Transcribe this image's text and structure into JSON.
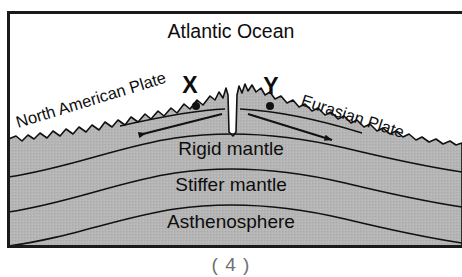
{
  "figure": {
    "title": "Atlantic Ocean",
    "caption": "( 4 )",
    "colors": {
      "mantle_fill": "#b5b5b5",
      "ocean_fill": "#ffffff",
      "line": "#111111",
      "frame": "#1a1a1a",
      "caption_text": "#6f6f6f"
    },
    "frame": {
      "left": 7,
      "top": 11,
      "right": 462,
      "bottom": 247,
      "stroke_width": 3
    }
  },
  "ocean_label": {
    "text": "Atlantic Ocean",
    "x": 231,
    "y": 38
  },
  "plate_labels": [
    {
      "name": "north-american-plate",
      "text": "North American Plate",
      "x": 18,
      "y": 128,
      "rotation": -17
    },
    {
      "name": "eurasian-plate",
      "text": "Eurasian Plate",
      "x": 300,
      "y": 105,
      "rotation": 18
    }
  ],
  "layer_labels": [
    {
      "name": "rigid-mantle",
      "text": "Rigid mantle",
      "x": 231,
      "y": 155
    },
    {
      "name": "stiffer-mantle",
      "text": "Stiffer mantle",
      "x": 231,
      "y": 191
    },
    {
      "name": "asthenosphere",
      "text": "Asthenosphere",
      "x": 231,
      "y": 228
    }
  ],
  "marked_points": [
    {
      "name": "point-x",
      "text": "X",
      "label_x": 190,
      "label_y": 93,
      "dot_x": 196,
      "dot_y": 106,
      "dot_r": 4
    },
    {
      "name": "point-y",
      "text": "Y",
      "label_x": 271,
      "label_y": 94,
      "dot_x": 270,
      "dot_y": 106,
      "dot_r": 4
    }
  ],
  "spreading_arrows": [
    {
      "name": "arrow-left-spreading",
      "direction": "left",
      "from_x": 222,
      "from_y": 114,
      "to_x": 139,
      "to_y": 135
    },
    {
      "name": "arrow-right-spreading",
      "direction": "right",
      "from_x": 248,
      "from_y": 114,
      "to_x": 332,
      "to_y": 140
    }
  ],
  "layer_boundaries": [
    {
      "name": "rigid-stiffer-boundary",
      "index": 1
    },
    {
      "name": "stiffer-asthenosphere-boundary",
      "index": 2
    },
    {
      "name": "asthenosphere-lower-boundary",
      "index": 3
    }
  ]
}
